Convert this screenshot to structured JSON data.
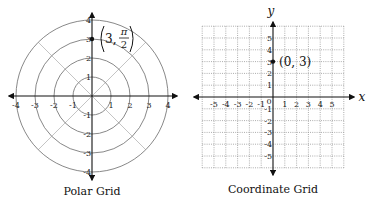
{
  "polar_grid": {
    "caption": "Polar Grid",
    "center": [
      92,
      96
    ],
    "radius_step": 19,
    "rings": [
      1,
      2,
      3,
      4
    ],
    "x_ticks": [
      "-4",
      "-3",
      "-2",
      "-1",
      "1",
      "2",
      "3",
      "4"
    ],
    "y_ticks": [
      "4",
      "3",
      "2",
      "1",
      "-1",
      "-2",
      "-3",
      "-4"
    ],
    "point": {
      "r": 3,
      "theta_numerator": "π",
      "theta_denominator": "2",
      "label_prefix": "3,"
    },
    "colors": {
      "ring": "#7a7a7a",
      "diagonal": "#b5b5b5",
      "axis": "#111111"
    }
  },
  "coordinate_grid": {
    "caption": "Coordinate Grid",
    "origin": [
      273,
      97
    ],
    "unit": 11.8,
    "extent": 6,
    "x_axis_label": "x",
    "y_axis_label": "y",
    "x_ticks": [
      "-5",
      "-4",
      "-3",
      "-2",
      "-1",
      "1",
      "2",
      "3",
      "4",
      "5"
    ],
    "y_ticks": [
      "5",
      "4",
      "3",
      "2",
      "1",
      "-1",
      "-2",
      "-3",
      "-4",
      "-5"
    ],
    "origin_label": "0",
    "point": {
      "x": 0,
      "y": 3,
      "label": "(0, 3)"
    },
    "colors": {
      "grid": "#8a8a8a",
      "axis": "#111111"
    }
  }
}
